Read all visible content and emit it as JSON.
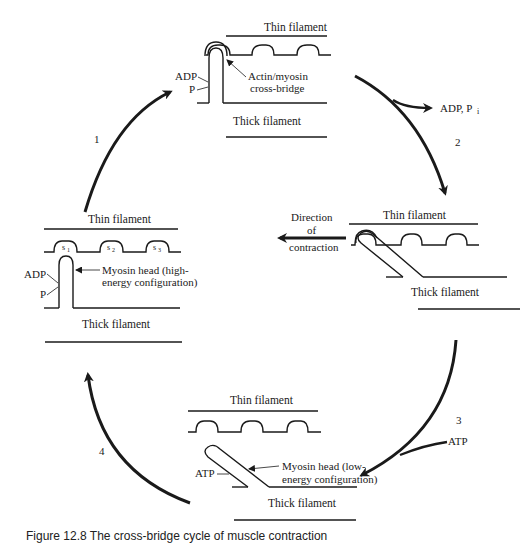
{
  "figure": {
    "title": "Cross-bridge cycle of muscle contraction",
    "caption": "Figure 12.8  The cross-bridge cycle of muscle contraction"
  },
  "panels": {
    "top": {
      "thin_label": "Thin filament",
      "thick_label": "Thick filament",
      "adp_label": "ADP",
      "p_label": "P",
      "callout_line1": "Actin/myosin",
      "callout_line2": "cross-bridge"
    },
    "right": {
      "thin_label": "Thin filament",
      "thick_label": "Thick filament",
      "direction_line1": "Direction",
      "direction_line2": "of",
      "direction_line3": "contraction"
    },
    "bottom": {
      "thin_label": "Thin filament",
      "thick_label": "Thick filament",
      "atp_label": "ATP",
      "callout_line1": "Myosin head (low-",
      "callout_line2": "energy configuration)"
    },
    "left": {
      "thin_label": "Thin filament",
      "thick_label": "Thick filament",
      "adp_label": "ADP",
      "p_label": "P",
      "site1": "s",
      "site2": "s",
      "site3": "s",
      "site1_sub": "1",
      "site2_sub": "2",
      "site3_sub": "3",
      "callout_line1": "Myosin head (high-",
      "callout_line2": "energy configuration)"
    }
  },
  "steps": {
    "step1": "1",
    "step2": "2",
    "step3": "3",
    "step4": "4",
    "release_label": "ADP, P",
    "release_sub": "i",
    "atp_input_label": "ATP"
  },
  "colors": {
    "ink": "#1a1a1a",
    "background": "#ffffff"
  }
}
